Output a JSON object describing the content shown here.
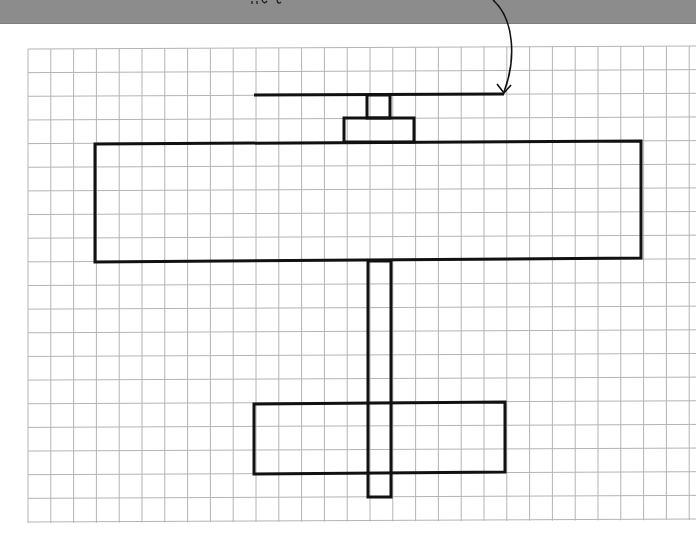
{
  "banner": {
    "color": "#8c8c8c",
    "caption_visible": "partially cropped (illegible)"
  },
  "grid": {
    "left": 28,
    "top": 49,
    "right": 696,
    "bottom": 522,
    "col_spacing": 22.8,
    "row_spacing": 23.65,
    "columns": 29,
    "rows": 20,
    "line_color": "#b4b4b4"
  },
  "drawing": {
    "subject": "airplane (top view)",
    "stroke_color": "#111111",
    "stroke_width": 3,
    "parts": {
      "propeller": {
        "x1": 254,
        "y1": 95,
        "x2": 504,
        "y2": 94
      },
      "prop_shaft": {
        "x": 367,
        "y": 95,
        "w": 23,
        "h": 23
      },
      "nose": {
        "x": 344,
        "y": 118,
        "w": 70,
        "h": 24
      },
      "wing": {
        "points": "95,144 641,141 641,258 95,262"
      },
      "fuselage": {
        "x": 368,
        "y": 261,
        "w": 23,
        "h": 236
      },
      "tail_plane": {
        "points": "254,404 505,402 505,472 254,474"
      }
    },
    "pointer_arrow": {
      "path": "M 493 0 C 515 20, 516 60, 504 92",
      "head": "497,84 504,93 511,85"
    }
  }
}
